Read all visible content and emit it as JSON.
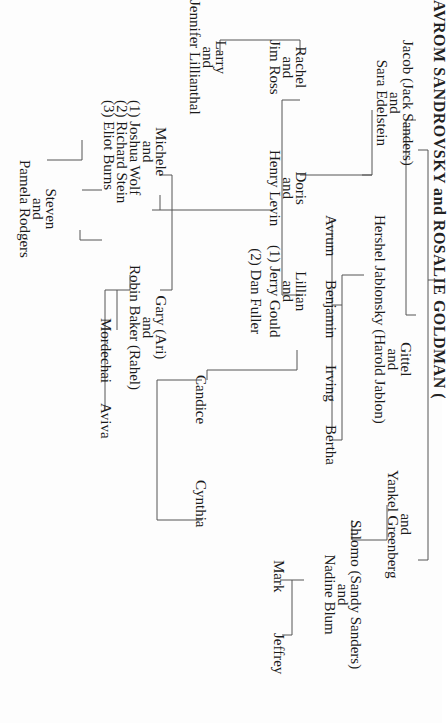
{
  "title": "AVROM SANDROVSKY and ROSALIE GOLDMAN (",
  "generation1": [
    {
      "name": "Jacob (Jack Sanders)",
      "and": "and",
      "spouse": "Sara Edelstein"
    },
    {
      "name": "Gittel",
      "and": "and",
      "spouse": "Hershel Jablonsky (Harold Jablon)"
    },
    {
      "and": "and",
      "name": "Yankel Greenberg"
    },
    {
      "name": "Shlomo (Sandy Sanders)",
      "and": "and",
      "spouse": "Nadine Blum"
    }
  ],
  "jacob_children": [
    {
      "name": "Rachel",
      "and": "and",
      "spouse": "Jim Ross"
    },
    {
      "name": "Doris",
      "and": "and",
      "spouse": "Henry Levin"
    },
    {
      "name": "Lillian",
      "and": "and",
      "spouse1": "(1) Jerry Gould",
      "spouse2": "(2) Dan Fuller"
    }
  ],
  "rachel_children": [
    {
      "name": "Larry",
      "and": "and",
      "spouse": "Jennifer Lillianthal"
    }
  ],
  "doris_children": [
    {
      "name": "Michele",
      "and": "and",
      "spouse1": "(1) Joshua Wolf",
      "spouse2": "(2) Richard Stein",
      "spouse3": "(3) Eliot Burns"
    },
    {
      "name": "Gary (Ari)",
      "and": "and",
      "spouse": "Robin Baker (Rahel)"
    }
  ],
  "michele_children": [
    {
      "name": "Steven",
      "and": "and",
      "spouse": "Pamela Rodgers"
    }
  ],
  "gary_children": [
    "Mordechai",
    "Aviva"
  ],
  "lillian_children": [
    "Candice",
    "Cynthia"
  ],
  "gittel_children": [
    "Avrum",
    "Benjamin",
    "Irving",
    "Bertha"
  ],
  "shlomo_children": [
    "Mark",
    "Jeffrey"
  ]
}
